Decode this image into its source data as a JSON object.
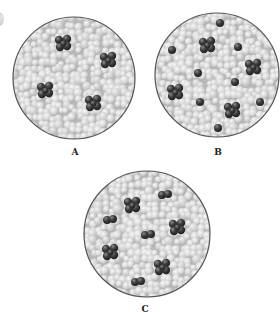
{
  "figure": {
    "background": "#ffffff",
    "colors": {
      "background_sphere": "#d9d9d9",
      "background_sphere_highlight": "#f4f4f4",
      "dark_sphere": "#3e3e3e",
      "dark_sphere_highlight": "#8a8a8a",
      "circle_border": "#555555",
      "label": "#222222"
    },
    "panels": [
      {
        "id": "A",
        "label": "A",
        "center": [
          74,
          78
        ],
        "radius": 61,
        "label_pos": [
          75,
          147
        ],
        "clusters": [
          [
            63,
            43
          ],
          [
            108,
            60
          ],
          [
            45,
            90
          ],
          [
            93,
            103
          ]
        ],
        "pairs": [],
        "singles": []
      },
      {
        "id": "B",
        "label": "B",
        "center": [
          217,
          75
        ],
        "radius": 62,
        "label_pos": [
          218,
          147
        ],
        "clusters": [
          [
            207,
            45
          ],
          [
            253,
            67
          ],
          [
            175,
            92
          ],
          [
            232,
            110
          ]
        ],
        "pairs": [],
        "singles": [
          [
            220,
            23
          ],
          [
            172,
            50
          ],
          [
            238,
            47
          ],
          [
            198,
            73
          ],
          [
            235,
            82
          ],
          [
            200,
            102
          ],
          [
            260,
            102
          ],
          [
            218,
            128
          ]
        ]
      },
      {
        "id": "C",
        "label": "C",
        "center": [
          147,
          234
        ],
        "radius": 63,
        "label_pos": [
          145,
          304
        ],
        "clusters": [
          [
            132,
            205
          ],
          [
            177,
            227
          ],
          [
            110,
            252
          ],
          [
            162,
            267
          ]
        ],
        "pairs": [
          [
            165,
            195
          ],
          [
            110,
            220
          ],
          [
            148,
            235
          ],
          [
            138,
            282
          ]
        ],
        "singles": []
      }
    ]
  }
}
